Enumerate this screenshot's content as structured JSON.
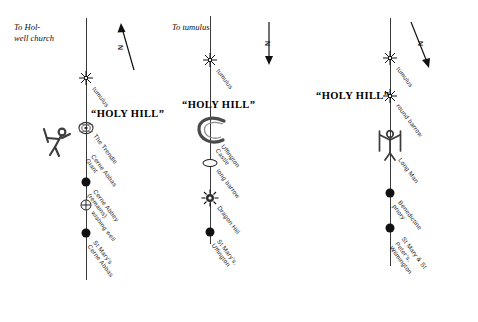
{
  "diagram": {
    "title_text": "Three parallel hill-figure alignment diagrams",
    "line_color": "#3a3a3a",
    "text_color": "#1a1a1a",
    "background": "#ffffff"
  },
  "columns": [
    {
      "id": "cerne-abbas",
      "to_caption": "To Hol-\nwell church",
      "holy_hill": "“HOLY HILL”",
      "compass_label": "N",
      "compass_direction": "up-left",
      "nodes": [
        {
          "label": "tumulus",
          "marker": "star"
        },
        {
          "label": "The Trendle",
          "marker": "trendle"
        },
        {
          "label": "Cerne Abbas Giant",
          "marker": "giant"
        },
        {
          "label": "Cerne Abbey (remains)",
          "marker": "dot"
        },
        {
          "label": "wishing well",
          "marker": "well"
        },
        {
          "label": "St Mary’s\nCerne Abbas",
          "marker": "dot"
        }
      ]
    },
    {
      "id": "uffington",
      "to_caption": "To tumulus",
      "holy_hill": "“HOLY  HILL”",
      "compass_label": "N",
      "compass_direction": "down",
      "nodes": [
        {
          "label": "tumulus",
          "marker": "star"
        },
        {
          "label": "Uffington Castle",
          "marker": "horseshoe"
        },
        {
          "label": "long barrow",
          "marker": "ellipse"
        },
        {
          "label": "Dragon Hill",
          "marker": "sunburst"
        },
        {
          "label": "St Mary’s,\nUffington",
          "marker": "dot"
        }
      ]
    },
    {
      "id": "wilmington",
      "to_caption": "",
      "holy_hill": "“HOLY HILL”",
      "compass_label": "N",
      "compass_direction": "down-right",
      "nodes": [
        {
          "label": "tumulus",
          "marker": "star"
        },
        {
          "label": "round barrow",
          "marker": "star"
        },
        {
          "label": "Long Man",
          "marker": "longman"
        },
        {
          "label": "Benedictine priory",
          "marker": "dot"
        },
        {
          "label": "St Mary & St Peter’s,\nWilmington",
          "marker": "dot"
        }
      ]
    }
  ]
}
